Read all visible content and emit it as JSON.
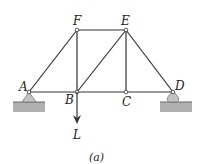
{
  "diagram": {
    "type": "truss",
    "caption": "(a)",
    "joints": [
      {
        "id": "A",
        "label": "A"
      },
      {
        "id": "B",
        "label": "B"
      },
      {
        "id": "C",
        "label": "C"
      },
      {
        "id": "D",
        "label": "D"
      },
      {
        "id": "E",
        "label": "E"
      },
      {
        "id": "F",
        "label": "F"
      }
    ],
    "members": [
      "AF",
      "AB",
      "BF",
      "BE",
      "BC",
      "CE",
      "CD",
      "DE",
      "EF"
    ],
    "supports": {
      "A": "pin",
      "D": "roller"
    },
    "load": {
      "at": "B",
      "label": "L",
      "direction": "down"
    },
    "colors": {
      "line": "#333333",
      "support": "#b8b8b8",
      "ground": "#a0a0a0"
    }
  }
}
